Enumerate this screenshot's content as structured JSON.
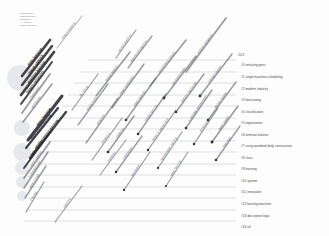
{
  "meta": {
    "lines": [
      "Topic Evolution",
      "Clustering Result",
      "ThemeRiver",
      "n = 15 topics",
      "window 2016-2019"
    ]
  },
  "legend": {
    "year": "2019",
    "items": [
      {
        "id": "#0",
        "label": "#0 retracing gens"
      },
      {
        "id": "#1",
        "label": "#1 single machine scheduling"
      },
      {
        "id": "#2",
        "label": "#2 modern industry"
      },
      {
        "id": "#3",
        "label": "#3 forecasting"
      },
      {
        "id": "#4",
        "label": "#4 classification"
      },
      {
        "id": "#5",
        "label": "#5 organization"
      },
      {
        "id": "#6",
        "label": "#6 terminal solution"
      },
      {
        "id": "#7",
        "label": "#7 using woodend daily construction"
      },
      {
        "id": "#8",
        "label": "#8 class"
      },
      {
        "id": "#9",
        "label": "#9 learning"
      },
      {
        "id": "#10",
        "label": "#10 system"
      },
      {
        "id": "#11",
        "label": "#11 innovation"
      },
      {
        "id": "#12",
        "label": "#12 learning machine"
      },
      {
        "id": "#13",
        "label": "#13 description logic"
      },
      {
        "id": "#14",
        "label": "#14 rol"
      }
    ]
  },
  "colors": {
    "background": "#fdfdfd",
    "stream_line": "#b9bcc4",
    "cluster_line": "#6d7078",
    "cluster_line_dark": "#2e3036",
    "node_dot": "#33353b",
    "bubble_fill": "#d5d7dc",
    "label_text": "#3d3d3d",
    "meta_text": "#777777"
  },
  "chart_data": {
    "type": "line",
    "xlabel": "",
    "ylabel": "",
    "grid": true,
    "legend_position": "right",
    "streams": [
      {
        "row": 0,
        "y": 60,
        "x_start": 88,
        "x_end": 236
      },
      {
        "row": 1,
        "y": 72,
        "x_start": 80,
        "x_end": 236
      },
      {
        "row": 2,
        "y": 83,
        "x_start": 74,
        "x_end": 236
      },
      {
        "row": 3,
        "y": 95,
        "x_start": 68,
        "x_end": 236
      },
      {
        "row": 4,
        "y": 106,
        "x_start": 62,
        "x_end": 236
      },
      {
        "row": 5,
        "y": 118,
        "x_start": 56,
        "x_end": 236
      },
      {
        "row": 6,
        "y": 129,
        "x_start": 50,
        "x_end": 236
      },
      {
        "row": 7,
        "y": 141,
        "x_start": 46,
        "x_end": 236
      },
      {
        "row": 8,
        "y": 152,
        "x_start": 42,
        "x_end": 236
      },
      {
        "row": 9,
        "y": 164,
        "x_start": 38,
        "x_end": 236
      },
      {
        "row": 10,
        "y": 175,
        "x_start": 34,
        "x_end": 236
      },
      {
        "row": 11,
        "y": 187,
        "x_start": 30,
        "x_end": 236
      },
      {
        "row": 12,
        "y": 198,
        "x_start": 28,
        "x_end": 236
      },
      {
        "row": 13,
        "y": 210,
        "x_start": 26,
        "x_end": 236
      },
      {
        "row": 14,
        "y": 221,
        "x_start": 24,
        "x_end": 236
      }
    ],
    "clusters": [
      {
        "label": "image processing",
        "x1": 57,
        "y1": 48,
        "x2": 82,
        "y2": 16,
        "weight": 0.9,
        "dot": false
      },
      {
        "label": "deep learning",
        "x1": 22,
        "y1": 76,
        "x2": 50,
        "y2": 40,
        "weight": 2.6,
        "dot": false
      },
      {
        "label": "neural network",
        "x1": 22,
        "y1": 85,
        "x2": 52,
        "y2": 46,
        "weight": 2.4,
        "dot": false
      },
      {
        "label": "machine learning",
        "x1": 21,
        "y1": 95,
        "x2": 54,
        "y2": 52,
        "weight": 2.8,
        "dot": false
      },
      {
        "label": "feature extraction",
        "x1": 21,
        "y1": 104,
        "x2": 52,
        "y2": 62,
        "weight": 2.0,
        "dot": false
      },
      {
        "label": "classification",
        "x1": 22,
        "y1": 113,
        "x2": 50,
        "y2": 74,
        "weight": 1.8,
        "dot": false
      },
      {
        "label": "optimization",
        "x1": 23,
        "y1": 122,
        "x2": 52,
        "y2": 84,
        "weight": 1.6,
        "dot": false
      },
      {
        "label": "deep learning",
        "x1": 28,
        "y1": 140,
        "x2": 62,
        "y2": 96,
        "weight": 3.0,
        "dot": false
      },
      {
        "label": "supervised learning",
        "x1": 26,
        "y1": 148,
        "x2": 58,
        "y2": 108,
        "weight": 2.2,
        "dot": false
      },
      {
        "label": "reinforcement learning",
        "x1": 30,
        "y1": 158,
        "x2": 66,
        "y2": 112,
        "weight": 2.4,
        "dot": false
      },
      {
        "label": "data mining",
        "x1": 24,
        "y1": 168,
        "x2": 52,
        "y2": 130,
        "weight": 2.0,
        "dot": false
      },
      {
        "label": "neural networks",
        "x1": 24,
        "y1": 178,
        "x2": 50,
        "y2": 142,
        "weight": 1.8,
        "dot": false
      },
      {
        "label": "knowledge graph",
        "x1": 24,
        "y1": 188,
        "x2": 48,
        "y2": 152,
        "weight": 1.6,
        "dot": false
      },
      {
        "label": "semantic web",
        "x1": 25,
        "y1": 198,
        "x2": 46,
        "y2": 166,
        "weight": 1.4,
        "dot": false
      },
      {
        "label": "ontology",
        "x1": 26,
        "y1": 212,
        "x2": 44,
        "y2": 182,
        "weight": 1.2,
        "dot": false
      },
      {
        "label": "text mining",
        "x1": 72,
        "y1": 110,
        "x2": 98,
        "y2": 74,
        "weight": 1.2,
        "dot": false
      },
      {
        "label": "segmentation",
        "x1": 78,
        "y1": 125,
        "x2": 108,
        "y2": 84,
        "weight": 1.3,
        "dot": false
      },
      {
        "label": "recognition",
        "x1": 86,
        "y1": 143,
        "x2": 118,
        "y2": 98,
        "weight": 1.3,
        "dot": false
      },
      {
        "label": "scheduling",
        "x1": 92,
        "y1": 160,
        "x2": 122,
        "y2": 118,
        "weight": 1.2,
        "dot": false
      },
      {
        "label": "prediction",
        "x1": 100,
        "y1": 175,
        "x2": 126,
        "y2": 140,
        "weight": 1.1,
        "dot": false
      },
      {
        "label": "algorithm",
        "x1": 55,
        "y1": 222,
        "x2": 82,
        "y2": 186,
        "weight": 1.1,
        "dot": false
      },
      {
        "label": "clustering",
        "x1": 108,
        "y1": 152,
        "x2": 134,
        "y2": 116,
        "weight": 1.4,
        "dot": true
      },
      {
        "label": "classification",
        "x1": 116,
        "y1": 172,
        "x2": 142,
        "y2": 136,
        "weight": 1.3,
        "dot": true
      },
      {
        "label": "optimization",
        "x1": 124,
        "y1": 190,
        "x2": 150,
        "y2": 152,
        "weight": 1.2,
        "dot": true
      },
      {
        "label": "feature selection",
        "x1": 96,
        "y1": 96,
        "x2": 130,
        "y2": 52,
        "weight": 1.6,
        "dot": false
      },
      {
        "label": "image classification",
        "x1": 112,
        "y1": 108,
        "x2": 144,
        "y2": 64,
        "weight": 1.5,
        "dot": false
      },
      {
        "label": "object detection",
        "x1": 126,
        "y1": 120,
        "x2": 156,
        "y2": 78,
        "weight": 1.4,
        "dot": true
      },
      {
        "label": "transfer learning",
        "x1": 138,
        "y1": 134,
        "x2": 166,
        "y2": 94,
        "weight": 1.4,
        "dot": true
      },
      {
        "label": "semantic segmentation",
        "x1": 148,
        "y1": 150,
        "x2": 176,
        "y2": 110,
        "weight": 1.3,
        "dot": true
      },
      {
        "label": "representation learning",
        "x1": 158,
        "y1": 168,
        "x2": 182,
        "y2": 132,
        "weight": 1.2,
        "dot": true
      },
      {
        "label": "graph learning",
        "x1": 166,
        "y1": 186,
        "x2": 188,
        "y2": 152,
        "weight": 1.1,
        "dot": true
      },
      {
        "label": "convolutional network",
        "x1": 150,
        "y1": 86,
        "x2": 186,
        "y2": 40,
        "weight": 1.6,
        "dot": false
      },
      {
        "label": "generative model",
        "x1": 164,
        "y1": 98,
        "x2": 196,
        "y2": 56,
        "weight": 1.5,
        "dot": true
      },
      {
        "label": "attention mechanism",
        "x1": 176,
        "y1": 112,
        "x2": 204,
        "y2": 74,
        "weight": 1.4,
        "dot": true
      },
      {
        "label": "knowledge representation",
        "x1": 186,
        "y1": 128,
        "x2": 212,
        "y2": 90,
        "weight": 1.4,
        "dot": true
      },
      {
        "label": "reinforcement",
        "x1": 194,
        "y1": 144,
        "x2": 218,
        "y2": 108,
        "weight": 1.3,
        "dot": true
      },
      {
        "label": "artificial intelligence",
        "x1": 186,
        "y1": 72,
        "x2": 226,
        "y2": 18,
        "weight": 1.8,
        "dot": false
      },
      {
        "label": "intelligent system",
        "x1": 200,
        "y1": 96,
        "x2": 232,
        "y2": 54,
        "weight": 1.5,
        "dot": true
      },
      {
        "label": "decision support",
        "x1": 208,
        "y1": 120,
        "x2": 236,
        "y2": 82,
        "weight": 1.4,
        "dot": true
      },
      {
        "label": "expert system",
        "x1": 212,
        "y1": 142,
        "x2": 238,
        "y2": 106,
        "weight": 1.6,
        "dot": true
      },
      {
        "label": "fuzzy logic",
        "x1": 216,
        "y1": 160,
        "x2": 240,
        "y2": 126,
        "weight": 1.4,
        "dot": true
      },
      {
        "label": "evolutionary algorithm",
        "x1": 128,
        "y1": 68,
        "x2": 152,
        "y2": 36,
        "weight": 1.3,
        "dot": false
      },
      {
        "label": "genetic algorithm",
        "x1": 116,
        "y1": 58,
        "x2": 136,
        "y2": 30,
        "weight": 1.2,
        "dot": false
      }
    ],
    "bubbles": [
      {
        "cx": 20,
        "cy": 78,
        "r": 13
      },
      {
        "cx": 22,
        "cy": 128,
        "r": 8
      },
      {
        "cx": 22,
        "cy": 152,
        "r": 9
      },
      {
        "cx": 22,
        "cy": 168,
        "r": 7
      },
      {
        "cx": 22,
        "cy": 182,
        "r": 6
      },
      {
        "cx": 22,
        "cy": 196,
        "r": 5
      }
    ]
  }
}
